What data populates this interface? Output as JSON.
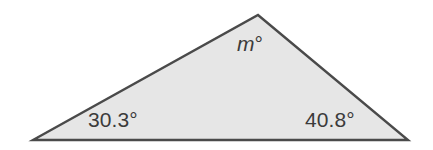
{
  "figure": {
    "type": "triangle-diagram",
    "background_color": "#ffffff",
    "shape": {
      "name": "triangle",
      "fill_color": "#e6e6e6",
      "stroke_color": "#4a4a4a",
      "stroke_width": 2.4,
      "vertices": [
        {
          "name": "bottom-left",
          "x": 33,
          "y": 140
        },
        {
          "name": "apex",
          "x": 258,
          "y": 15
        },
        {
          "name": "bottom-right",
          "x": 408,
          "y": 140
        }
      ],
      "points_attr": "33,140 258,15 408,140"
    },
    "labels": {
      "bottom_left_angle": "30.3°",
      "apex_angle_variable": "m",
      "apex_angle_degree_symbol": "°",
      "bottom_right_angle": "40.8°"
    },
    "text_color": "#3b3b3b"
  }
}
